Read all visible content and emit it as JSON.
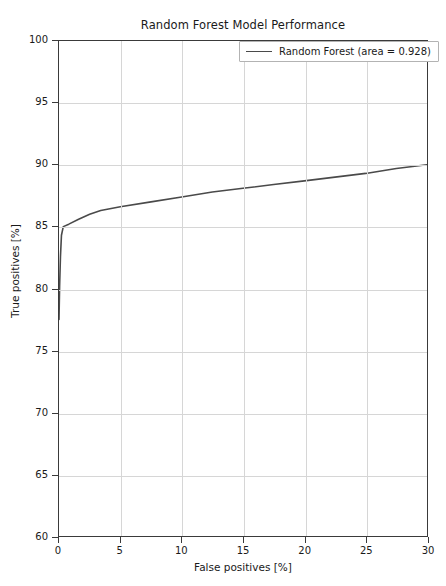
{
  "chart_data": {
    "type": "line",
    "title": "Random Forest Model Performance",
    "xlabel": "False positives [%]",
    "ylabel": "True positives [%]",
    "xlim": [
      0,
      30
    ],
    "ylim": [
      60,
      100
    ],
    "xticks": [
      0,
      5,
      10,
      15,
      20,
      25,
      30
    ],
    "yticks": [
      60,
      65,
      70,
      75,
      80,
      85,
      90,
      95,
      100
    ],
    "xtick_labels": [
      "0",
      "5",
      "10",
      "15",
      "20",
      "25",
      "30"
    ],
    "ytick_labels": [
      "60",
      "65",
      "70",
      "75",
      "80",
      "85",
      "90",
      "95",
      "100"
    ],
    "grid": true,
    "legend_position": "upper right",
    "series": [
      {
        "name": "Random Forest (area = 0.928)",
        "color": "#4a4a4a",
        "area": 0.928,
        "x": [
          0.0,
          0.05,
          0.12,
          0.2,
          0.35,
          0.8,
          1.6,
          2.5,
          3.4,
          5.0,
          7.5,
          10.0,
          12.5,
          15.0,
          17.5,
          20.0,
          22.5,
          25.0,
          27.5,
          30.0
        ],
        "y": [
          77.5,
          80.2,
          82.6,
          84.3,
          85.0,
          85.2,
          85.6,
          86.0,
          86.3,
          86.6,
          87.0,
          87.4,
          87.8,
          88.1,
          88.4,
          88.7,
          89.0,
          89.3,
          89.7,
          90.0
        ]
      }
    ]
  },
  "legend": {
    "entry_label": "Random Forest (area = 0.928)"
  }
}
